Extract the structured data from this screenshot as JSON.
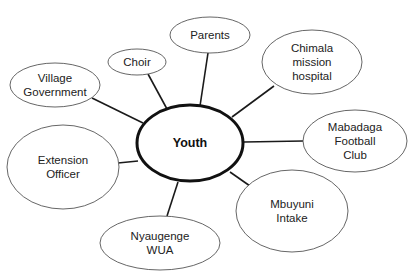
{
  "diagram": {
    "type": "stakeholder-map",
    "center": {
      "label": "Youth",
      "cx": 190,
      "cy": 143,
      "rx": 53,
      "ry": 38
    },
    "nodes": [
      {
        "id": "choir",
        "lines": [
          "Choir"
        ],
        "cx": 137,
        "cy": 62,
        "rx": 29,
        "ry": 13,
        "edge": [
          148,
          74,
          167,
          109
        ]
      },
      {
        "id": "parents",
        "lines": [
          "Parents"
        ],
        "cx": 210,
        "cy": 35,
        "rx": 40,
        "ry": 18,
        "edge": [
          208,
          53,
          200,
          106
        ]
      },
      {
        "id": "chimala-mission-hospital",
        "lines": [
          "Chimala",
          "mission",
          "hospital"
        ],
        "cx": 312,
        "cy": 62,
        "rx": 50,
        "ry": 32,
        "edge": [
          274,
          86,
          232,
          117
        ]
      },
      {
        "id": "village-government",
        "lines": [
          "Village",
          "Government"
        ],
        "cx": 55,
        "cy": 85,
        "rx": 45,
        "ry": 22,
        "edge": [
          92,
          98,
          143,
          123
        ]
      },
      {
        "id": "mabadaga-football-club",
        "lines": [
          "Mabadaga",
          "Football",
          "Club"
        ],
        "cx": 355,
        "cy": 141,
        "rx": 52,
        "ry": 31,
        "edge": [
          244,
          142,
          303,
          141
        ]
      },
      {
        "id": "extension-officer",
        "lines": [
          "Extension",
          "Officer"
        ],
        "cx": 63,
        "cy": 167,
        "rx": 56,
        "ry": 42,
        "edge": [
          118,
          163,
          138,
          161
        ]
      },
      {
        "id": "mbuyuni-intake",
        "lines": [
          "Mbuyuni",
          "Intake"
        ],
        "cx": 292,
        "cy": 211,
        "rx": 56,
        "ry": 41,
        "edge": [
          230,
          172,
          250,
          186
        ]
      },
      {
        "id": "nyaugenge-wua",
        "lines": [
          "Nyaugenge",
          "WUA"
        ],
        "cx": 160,
        "cy": 243,
        "rx": 60,
        "ry": 27,
        "edge": [
          178,
          182,
          167,
          216
        ]
      }
    ],
    "colors": {
      "background": "#ffffff",
      "center_stroke": "#111111",
      "node_stroke": "#555555",
      "edge": "#1a1a1a",
      "text": "#222222"
    }
  }
}
